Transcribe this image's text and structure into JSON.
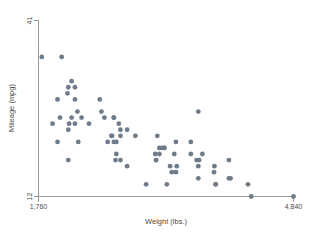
{
  "chart_data": {
    "type": "scatter",
    "title": "",
    "xlabel": "Weight (lbs.)",
    "ylabel": "Mileage (mpg)",
    "xlim": [
      1760,
      4840
    ],
    "ylim": [
      12,
      41
    ],
    "xticks": [
      1760,
      4840
    ],
    "xticklabels": [
      "1,760",
      "4,840"
    ],
    "yticks": [
      12,
      41
    ],
    "yticklabels": [
      "12",
      "41"
    ],
    "grid": false,
    "legend": false,
    "marker_color": "#6f7b8a",
    "marker_size": 2.4,
    "axis_color": "#9a9a9a",
    "background": "#ffffff",
    "series": [
      {
        "name": "mpg vs weight",
        "points": [
          [
            2930,
            22
          ],
          [
            3350,
            17
          ],
          [
            2640,
            22
          ],
          [
            3250,
            20
          ],
          [
            4080,
            15
          ],
          [
            3670,
            18
          ],
          [
            2230,
            26
          ],
          [
            3280,
            20
          ],
          [
            3880,
            16
          ],
          [
            3400,
            19
          ],
          [
            3310,
            14
          ],
          [
            3060,
            14
          ],
          [
            3600,
            21
          ],
          [
            2700,
            19
          ],
          [
            3690,
            26
          ],
          [
            3180,
            18
          ],
          [
            3220,
            19
          ],
          [
            4060,
            18
          ],
          [
            3600,
            19
          ],
          [
            3740,
            19
          ],
          [
            4840,
            12
          ],
          [
            3900,
            14
          ],
          [
            4330,
            12
          ],
          [
            3900,
            14
          ],
          [
            4290,
            14
          ],
          [
            2110,
            29
          ],
          [
            2200,
            28
          ],
          [
            2520,
            26
          ],
          [
            2130,
            24
          ],
          [
            2650,
            22
          ],
          [
            1800,
            35
          ],
          [
            1990,
            28
          ],
          [
            3420,
            21
          ],
          [
            3195,
            22
          ],
          [
            3885,
            17
          ],
          [
            2500,
            28
          ],
          [
            2200,
            24
          ],
          [
            2670,
            25
          ],
          [
            3700,
            18
          ],
          [
            3690,
            17
          ],
          [
            3180,
            18
          ],
          [
            3220,
            20
          ],
          [
            4060,
            15
          ],
          [
            2750,
            18
          ],
          [
            3430,
            17
          ],
          [
            2120,
            23
          ],
          [
            2670,
            25
          ],
          [
            2595,
            21
          ],
          [
            2700,
            21
          ],
          [
            2556,
            25
          ],
          [
            2730,
            24
          ],
          [
            2830,
            23
          ],
          [
            2240,
            21
          ],
          [
            2370,
            24
          ],
          [
            2020,
            25
          ],
          [
            2280,
            25
          ],
          [
            2750,
            23
          ],
          [
            2120,
            30
          ],
          [
            2160,
            31
          ],
          [
            2040,
            35
          ],
          [
            1930,
            24
          ],
          [
            1990,
            21
          ],
          [
            3170,
            19
          ],
          [
            2690,
            18
          ],
          [
            3690,
            15
          ],
          [
            3370,
            16
          ],
          [
            2830,
            17
          ],
          [
            2200,
            30
          ],
          [
            2670,
            21
          ],
          [
            2160,
            25
          ],
          [
            2750,
            22
          ],
          [
            2120,
            18
          ],
          [
            3280,
            20
          ],
          [
            3420,
            16
          ]
        ]
      }
    ]
  },
  "axes": {
    "x_title": "Weight (lbs.)",
    "y_title": "Mileage (mpg)",
    "x_tick_min": "1,760",
    "x_tick_max": "4,840",
    "y_tick_min": "12",
    "y_tick_max": "41"
  }
}
